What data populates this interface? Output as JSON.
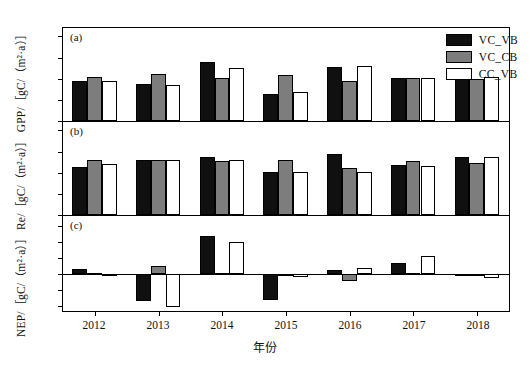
{
  "axis_title_y": "NEP/［gC/（m²·a）］  Re/［gC/（m²·a）］  GPP/［gC/（m²·a）］",
  "axis_title_x": "年份",
  "legend": [
    {
      "label": "VC_VB",
      "color": "#101010"
    },
    {
      "label": "VC_CB",
      "color": "#7d7d7d"
    },
    {
      "label": "CC_VB",
      "color": "#ffffff"
    }
  ],
  "panel_tags": {
    "a": "(a)",
    "b": "(b)",
    "c": "(c)"
  },
  "chart_data": [
    {
      "type": "bar",
      "panel": "(a)",
      "title": "",
      "xlabel": "年份",
      "ylabel": "GPP/［gC/（m²·a）］",
      "categories": [
        "2012",
        "2013",
        "2014",
        "2015",
        "2016",
        "2017",
        "2018"
      ],
      "ylim": [
        0,
        440
      ],
      "yticks": [
        0,
        100,
        200,
        300,
        400
      ],
      "grid": false,
      "legend_position": "top-right",
      "series": [
        {
          "name": "VC_VB",
          "color": "#101010",
          "values": [
            188,
            176,
            278,
            130,
            255,
            205,
            212
          ]
        },
        {
          "name": "VC_CB",
          "color": "#7d7d7d",
          "values": [
            208,
            221,
            205,
            218,
            188,
            203,
            200
          ]
        },
        {
          "name": "CC_VB",
          "color": "#ffffff",
          "values": [
            189,
            171,
            253,
            139,
            262,
            204,
            210
          ]
        }
      ]
    },
    {
      "type": "bar",
      "panel": "(b)",
      "title": "",
      "xlabel": "年份",
      "ylabel": "Re/［gC/（m²·a）］",
      "categories": [
        "2012",
        "2013",
        "2014",
        "2015",
        "2016",
        "2017",
        "2018"
      ],
      "ylim": [
        0,
        352
      ],
      "yticks": [
        0,
        80,
        160,
        240,
        320
      ],
      "grid": false,
      "legend_position": "none",
      "series": [
        {
          "name": "VC_VB",
          "color": "#101010",
          "values": [
            182,
            209,
            218,
            163,
            231,
            190,
            218
          ]
        },
        {
          "name": "VC_CB",
          "color": "#7d7d7d",
          "values": [
            208,
            209,
            206,
            209,
            179,
            205,
            195
          ]
        },
        {
          "name": "CC_VB",
          "color": "#ffffff",
          "values": [
            192,
            208,
            210,
            162,
            163,
            184,
            220
          ]
        }
      ]
    },
    {
      "type": "bar",
      "panel": "(c)",
      "title": "",
      "xlabel": "年份",
      "ylabel": "NEP/［gC/（m²·a）］",
      "categories": [
        "2012",
        "2013",
        "2014",
        "2015",
        "2016",
        "2017",
        "2018"
      ],
      "ylim": [
        -48,
        72
      ],
      "yticks": [
        -40,
        -20,
        0,
        20,
        40,
        60
      ],
      "grid": false,
      "legend_position": "none",
      "series": [
        {
          "name": "VC_VB",
          "color": "#101010",
          "values": [
            6,
            -34,
            47,
            -33,
            5,
            13,
            -1
          ]
        },
        {
          "name": "VC_CB",
          "color": "#7d7d7d",
          "values": [
            1,
            10,
            1,
            -1,
            -9,
            1,
            -2
          ]
        },
        {
          "name": "CC_VB",
          "color": "#ffffff",
          "values": [
            0,
            -42,
            40,
            -4,
            7,
            22,
            -5
          ]
        }
      ]
    }
  ]
}
